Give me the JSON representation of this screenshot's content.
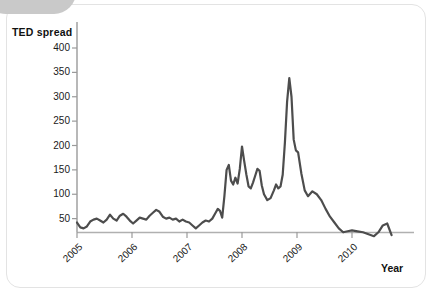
{
  "figure": {
    "y_axis_title": "TED spread",
    "x_axis_title": "Year"
  },
  "chart_data": {
    "type": "line",
    "title": "TED spread",
    "xlabel": "Year",
    "ylabel": "TED spread",
    "xlim": [
      2005.0,
      2010.75
    ],
    "ylim": [
      0,
      425
    ],
    "grid": false,
    "legend": null,
    "yticks": [
      50,
      100,
      150,
      200,
      250,
      300,
      350,
      400
    ],
    "xticks": [
      2005,
      2006,
      2007,
      2008,
      2009,
      2010
    ],
    "xtick_labels": [
      "2005",
      "2006",
      "2007",
      "2008",
      "2009",
      "2010"
    ],
    "line_color": "#4d4d4d",
    "line_width": 2.2,
    "units": "basis points",
    "series": [
      {
        "name": "TED spread",
        "x": [
          2005.0,
          2005.06,
          2005.12,
          2005.18,
          2005.24,
          2005.3,
          2005.36,
          2005.42,
          2005.48,
          2005.54,
          2005.6,
          2005.66,
          2005.72,
          2005.78,
          2005.84,
          2005.9,
          2005.96,
          2006.02,
          2006.08,
          2006.14,
          2006.2,
          2006.26,
          2006.32,
          2006.38,
          2006.44,
          2006.5,
          2006.56,
          2006.62,
          2006.68,
          2006.74,
          2006.8,
          2006.86,
          2006.92,
          2006.98,
          2007.04,
          2007.1,
          2007.16,
          2007.22,
          2007.28,
          2007.34,
          2007.4,
          2007.46,
          2007.52,
          2007.56,
          2007.6,
          2007.64,
          2007.68,
          2007.72,
          2007.76,
          2007.8,
          2007.84,
          2007.88,
          2007.92,
          2007.96,
          2008.0,
          2008.04,
          2008.08,
          2008.12,
          2008.16,
          2008.2,
          2008.24,
          2008.28,
          2008.32,
          2008.36,
          2008.4,
          2008.46,
          2008.52,
          2008.58,
          2008.62,
          2008.66,
          2008.7,
          2008.74,
          2008.78,
          2008.82,
          2008.86,
          2008.9,
          2008.94,
          2008.98,
          2009.02,
          2009.08,
          2009.14,
          2009.2,
          2009.28,
          2009.36,
          2009.44,
          2009.52,
          2009.6,
          2009.68,
          2009.76,
          2009.84,
          2009.92,
          2010.0,
          2010.1,
          2010.2,
          2010.3,
          2010.4,
          2010.48,
          2010.56,
          2010.64,
          2010.72
        ],
        "y": [
          42,
          32,
          30,
          34,
          44,
          48,
          50,
          46,
          42,
          48,
          58,
          50,
          46,
          56,
          60,
          54,
          46,
          40,
          46,
          52,
          50,
          48,
          56,
          62,
          68,
          64,
          54,
          50,
          52,
          48,
          50,
          44,
          48,
          44,
          42,
          36,
          30,
          36,
          42,
          46,
          44,
          50,
          62,
          70,
          66,
          52,
          96,
          150,
          160,
          128,
          120,
          134,
          122,
          152,
          198,
          168,
          140,
          116,
          112,
          124,
          138,
          152,
          148,
          118,
          100,
          88,
          92,
          108,
          120,
          112,
          116,
          140,
          206,
          290,
          338,
          300,
          212,
          190,
          186,
          142,
          108,
          96,
          106,
          100,
          88,
          70,
          54,
          42,
          30,
          22,
          24,
          26,
          24,
          22,
          18,
          14,
          22,
          36,
          40,
          16
        ]
      }
    ],
    "annotations": []
  }
}
